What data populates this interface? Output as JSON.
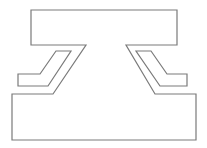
{
  "diagram": {
    "type": "line-drawing",
    "stroke_color": "#7a7a7a",
    "background": "#ffffff",
    "stroke_width": 1.2,
    "shapes": {
      "main_outline": "31,10 177,10 177,45 126,45 155,94 196,94 196,140 12,140 12,94 53,94 86,45 31,45",
      "left_bracket": "56,51 71,51 48,86 18,86 18,74 40,74",
      "right_bracket": "136,51 151,51 167,74 187,74 187,86 160,86"
    }
  }
}
